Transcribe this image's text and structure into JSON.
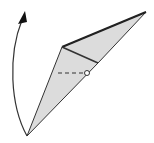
{
  "diagram": {
    "type": "origami-fold-step",
    "colors": {
      "paper_fill": "#dcdcdc",
      "line": "#333333",
      "edge_bold": "#222222",
      "background": "#ffffff"
    },
    "elements": [
      {
        "name": "folded-paper-shape",
        "kind": "polygon"
      },
      {
        "name": "crease-line",
        "kind": "line"
      },
      {
        "name": "dashed-fold-line",
        "kind": "dashed-line"
      },
      {
        "name": "pivot-point-circle",
        "kind": "circle"
      },
      {
        "name": "rotation-arrow",
        "kind": "curved-arrow"
      }
    ]
  }
}
